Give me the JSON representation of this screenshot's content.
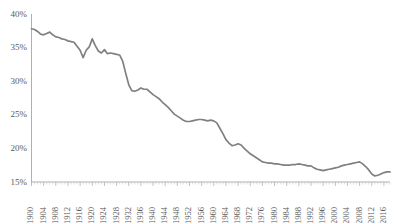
{
  "chart_data": {
    "type": "line",
    "title": "",
    "subtitle": "",
    "xlabel": "",
    "ylabel": "",
    "xlim": [
      1900,
      2018
    ],
    "ylim": [
      15,
      40
    ],
    "ytick_values": [
      40,
      35,
      30,
      25,
      20,
      15
    ],
    "ytick_labels": [
      "40%",
      "35%",
      "30%",
      "25%",
      "20%",
      "15%"
    ],
    "ytick_step": 5,
    "xtick_labels": [
      "1900",
      "1904",
      "1908",
      "1912",
      "1916",
      "1920",
      "1924",
      "1928",
      "1932",
      "1936",
      "1940",
      "1944",
      "1948",
      "1952",
      "1956",
      "1960",
      "1964",
      "1968",
      "1972",
      "1976",
      "1980",
      "1984",
      "1988",
      "1992",
      "1996",
      "2000",
      "2004",
      "2008",
      "2012",
      "2016"
    ],
    "xtick_step": 4,
    "xtick_minor_step": 1,
    "grid": "horizontal",
    "legend": "none",
    "series": [
      {
        "name": "",
        "color": "#808080",
        "x": [
          1900,
          1901,
          1902,
          1903,
          1904,
          1905,
          1906,
          1907,
          1908,
          1909,
          1910,
          1911,
          1912,
          1913,
          1914,
          1915,
          1916,
          1917,
          1918,
          1919,
          1920,
          1921,
          1922,
          1923,
          1924,
          1925,
          1926,
          1927,
          1928,
          1929,
          1930,
          1931,
          1932,
          1933,
          1934,
          1935,
          1936,
          1937,
          1938,
          1939,
          1940,
          1941,
          1942,
          1943,
          1944,
          1945,
          1946,
          1947,
          1948,
          1949,
          1950,
          1951,
          1952,
          1953,
          1954,
          1955,
          1956,
          1957,
          1958,
          1959,
          1960,
          1961,
          1962,
          1963,
          1964,
          1965,
          1966,
          1967,
          1968,
          1969,
          1970,
          1971,
          1972,
          1973,
          1974,
          1975,
          1976,
          1977,
          1978,
          1979,
          1980,
          1981,
          1982,
          1983,
          1984,
          1985,
          1986,
          1987,
          1988,
          1989,
          1990,
          1991,
          1992,
          1993,
          1994,
          1995,
          1996,
          1997,
          1998,
          1999,
          2000,
          2001,
          2002,
          2003,
          2004,
          2005,
          2006,
          2007,
          2008,
          2009,
          2010,
          2011,
          2012,
          2013,
          2014,
          2015,
          2016,
          2017,
          2018
        ],
        "values": [
          37.8,
          37.7,
          37.4,
          37.0,
          36.9,
          37.1,
          37.3,
          36.9,
          36.6,
          36.5,
          36.3,
          36.2,
          36.0,
          35.9,
          35.8,
          35.2,
          34.6,
          33.5,
          34.6,
          35.1,
          36.3,
          35.3,
          34.5,
          34.2,
          34.7,
          34.1,
          34.2,
          34.1,
          34.0,
          33.9,
          33.0,
          31.2,
          29.5,
          28.6,
          28.5,
          28.7,
          29.0,
          28.8,
          28.8,
          28.4,
          28.0,
          27.7,
          27.4,
          26.9,
          26.5,
          26.1,
          25.6,
          25.1,
          24.8,
          24.5,
          24.2,
          24.0,
          24.0,
          24.1,
          24.2,
          24.3,
          24.3,
          24.2,
          24.1,
          24.2,
          24.1,
          23.8,
          23.0,
          22.2,
          21.3,
          20.8,
          20.4,
          20.5,
          20.7,
          20.5,
          20.0,
          19.6,
          19.2,
          18.9,
          18.6,
          18.3,
          18.0,
          17.9,
          17.8,
          17.8,
          17.7,
          17.7,
          17.6,
          17.5,
          17.5,
          17.5,
          17.6,
          17.6,
          17.7,
          17.6,
          17.5,
          17.4,
          17.4,
          17.1,
          16.9,
          16.8,
          16.7,
          16.8,
          16.9,
          17.0,
          17.1,
          17.2,
          17.4,
          17.5,
          17.6,
          17.7,
          17.8,
          17.9,
          18.0,
          17.7,
          17.3,
          16.8,
          16.2,
          15.9,
          16.0,
          16.2,
          16.4,
          16.5,
          16.5
        ]
      }
    ]
  }
}
